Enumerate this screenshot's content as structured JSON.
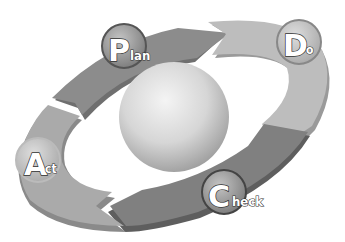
{
  "diagram": {
    "type": "PDCA cycle",
    "center": "sphere",
    "stages": [
      {
        "id": "plan",
        "initial": "P",
        "rest": "lan",
        "label": "Plan",
        "color": "#8a8a8a"
      },
      {
        "id": "do",
        "initial": "D",
        "rest": "o",
        "label": "Do",
        "color": "#b8b8b8"
      },
      {
        "id": "check",
        "initial": "C",
        "rest": "heck",
        "label": "Check",
        "color": "#7e7e7e"
      },
      {
        "id": "act",
        "initial": "A",
        "rest": "ct",
        "label": "Act",
        "color": "#a6a6a6"
      }
    ],
    "colors": {
      "background": "#ffffff",
      "sphere_light": "#f2f2f2",
      "sphere_dark": "#9a9a9a",
      "badge_ring": "#555555",
      "badge_fill": "#9c9c9c",
      "text_fill": "#ffffff",
      "text_outline": "#333333"
    }
  }
}
